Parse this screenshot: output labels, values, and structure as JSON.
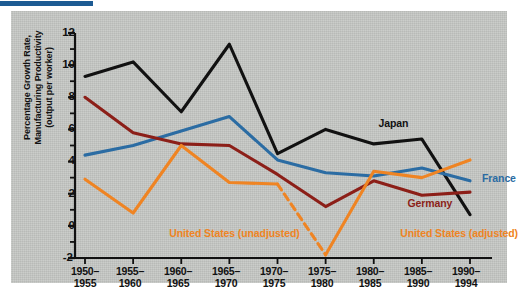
{
  "figure": {
    "background_color": "#ffffff",
    "panel_color": "#c5c7c4",
    "rule_color": "#1d5b93"
  },
  "chart_data": {
    "type": "line",
    "title": "",
    "xlabel": "",
    "ylabel": "Percentage Growth Rate, Manufacturing Productivity (output per worker)",
    "ylabel_lines": [
      "Percentage Growth Rate,",
      "Manufacturing Productivity",
      "(output per worker)"
    ],
    "categories": [
      "1950–\n1955",
      "1955–\n1960",
      "1960–\n1965",
      "1965–\n1970",
      "1970–\n1975",
      "1975–\n1980",
      "1980–\n1985",
      "1985–\n1990",
      "1990–\n1994"
    ],
    "x_tick_labels": [
      {
        "top": "1950–",
        "bottom": "1955"
      },
      {
        "top": "1955–",
        "bottom": "1960"
      },
      {
        "top": "1960–",
        "bottom": "1965"
      },
      {
        "top": "1965–",
        "bottom": "1970"
      },
      {
        "top": "1970–",
        "bottom": "1975"
      },
      {
        "top": "1975–",
        "bottom": "1980"
      },
      {
        "top": "1980–",
        "bottom": "1985"
      },
      {
        "top": "1985–",
        "bottom": "1990"
      },
      {
        "top": "1990–",
        "bottom": "1994"
      }
    ],
    "ylim": [
      -2,
      12
    ],
    "y_tick_labels": [
      "12",
      "10",
      "8",
      "6",
      "4",
      "2",
      "0",
      "-2"
    ],
    "y_tick_values": [
      12,
      10,
      8,
      6,
      4,
      2,
      0,
      -2
    ],
    "y_minor_tick_step": 1,
    "grid": false,
    "legend_position": "inline-annotations",
    "series": [
      {
        "name": "Japan",
        "color": "#111111",
        "style": "solid",
        "values": [
          9.3,
          10.2,
          7.1,
          11.3,
          4.5,
          6.0,
          5.1,
          5.4,
          0.7
        ]
      },
      {
        "name": "France",
        "color": "#2b6ca3",
        "style": "solid",
        "values": [
          4.4,
          5.0,
          5.9,
          6.8,
          4.1,
          3.3,
          3.1,
          3.6,
          2.8
        ]
      },
      {
        "name": "Germany",
        "color": "#8c1f18",
        "style": "solid",
        "values": [
          8.0,
          5.8,
          5.1,
          5.0,
          3.2,
          1.2,
          2.8,
          1.9,
          2.1
        ]
      },
      {
        "name": "United States (unadjusted)",
        "color": "#ef8423",
        "style": "solid",
        "values": [
          2.9,
          0.8,
          5.0,
          2.7,
          2.6,
          -1.8,
          3.4,
          3.0,
          4.1
        ],
        "dashed_segments": [
          [
            4,
            5
          ]
        ]
      }
    ],
    "annotations": [
      {
        "text": "Japan",
        "color": "#111111",
        "x_index": 6.1,
        "y_value": 6.4
      },
      {
        "text": "France",
        "color": "#2b6ca3",
        "x_index": 8.25,
        "y_value": 3.0
      },
      {
        "text": "Germany",
        "color": "#8c1f18",
        "x_index": 6.7,
        "y_value": 1.4
      },
      {
        "text": "United States (unadjusted)",
        "color": "#ef8423",
        "x_index": 1.75,
        "y_value": -0.45
      },
      {
        "text": "United States (adjusted)",
        "color": "#ef8423",
        "x_index": 6.55,
        "y_value": -0.45
      }
    ]
  }
}
